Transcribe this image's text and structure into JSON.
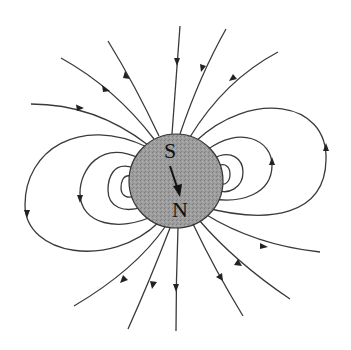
{
  "diagram": {
    "title": "",
    "sphere": {
      "cx": 176,
      "cy": 181,
      "r": 47,
      "fill": "#9a9a9a"
    },
    "labels": {
      "south": "S",
      "north": "N"
    },
    "colors": {
      "line": "#3a3a3a",
      "sphere": "#9a9a9a",
      "background": "#ffffff"
    },
    "field_lines": {
      "incoming_top_count": 6,
      "outgoing_bottom_count": 6,
      "left_loops_count": 4,
      "right_loops_count": 4
    }
  }
}
